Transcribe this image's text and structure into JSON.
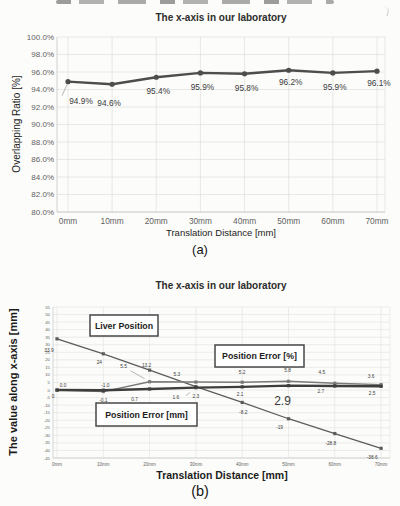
{
  "page": {
    "caption_a": "(a)",
    "caption_b": "(b)"
  },
  "chart_data": [
    {
      "type": "line",
      "title": "The x-axis in our laboratory",
      "xlabel": "Translation Distance [mm]",
      "ylabel": "Overlapping Ratio [%]",
      "categories": [
        "0mm",
        "10mm",
        "20mm",
        "30mm",
        "40mm",
        "50mm",
        "60mm",
        "70mm"
      ],
      "ylim": [
        80,
        100
      ],
      "ytick_step": 2,
      "ytick_format": "percent1",
      "grid": true,
      "legend_position": "none",
      "marker": "circle",
      "series": [
        {
          "name": "Overlapping Ratio [%]",
          "color": "#4d4d4d",
          "width": 2.3,
          "values": [
            94.9,
            94.6,
            95.4,
            95.9,
            95.8,
            96.2,
            95.9,
            96.1
          ],
          "labels": [
            {
              "t": "94.9%",
              "dx": 13,
              "dy": 22,
              "leader": [
                -1,
                3,
                -6,
                14
              ]
            },
            {
              "t": "94.6%",
              "dx": -3,
              "dy": 22
            },
            {
              "t": "95.4%",
              "dx": 2,
              "dy": 17
            },
            {
              "t": "95.9%",
              "dx": 2,
              "dy": 17
            },
            {
              "t": "95.8%",
              "dx": 2,
              "dy": 17
            },
            {
              "t": "96.2%",
              "dx": 2,
              "dy": 15
            },
            {
              "t": "95.9%",
              "dx": 2,
              "dy": 17
            },
            {
              "t": "96.1%",
              "dx": 2,
              "dy": 15
            }
          ]
        }
      ]
    },
    {
      "type": "line",
      "title": "The x-axis in our laboratory",
      "xlabel": "Translation Distance [mm]",
      "ylabel": "The value along x-axis [mm]",
      "categories": [
        "0mm",
        "10mm",
        "20mm",
        "30mm",
        "40mm",
        "50mm",
        "60mm",
        "70mm"
      ],
      "ylim": [
        -45,
        55
      ],
      "ytick_step": 5,
      "ytick_format": "plain",
      "grid": true,
      "legend_position": "inside-boxes",
      "marker": "square",
      "series": [
        {
          "name": "Liver Position",
          "color": "#5c5c5c",
          "width": 1.3,
          "values": [
            33.9,
            24,
            13.2,
            2.3,
            -8.2,
            -19,
            -28.8,
            -38.6
          ],
          "labels": [
            {
              "t": "33.9",
              "dx": -8,
              "dy": 13
            },
            {
              "t": "24",
              "dx": -4,
              "dy": 10
            },
            {
              "t": "13.2",
              "dx": -3,
              "dy": -3,
              "leader": [
                -2,
                -2,
                0,
                0
              ]
            },
            {
              "t": "2.3",
              "dx": 0,
              "dy": 11,
              "leader": [
                -6,
                6,
                -10,
                9
              ]
            },
            {
              "t": "-8.2",
              "dx": 1,
              "dy": 12
            },
            {
              "t": "-19",
              "dx": -9,
              "dy": 10
            },
            {
              "t": "-28.8",
              "dx": -4,
              "dy": 11
            },
            {
              "t": "-38.6",
              "dx": -9,
              "dy": 11
            }
          ]
        },
        {
          "name": "Position Error [%]",
          "color": "#7a7a7a",
          "width": 1.4,
          "values": [
            0.0,
            -1.0,
            5.5,
            5.3,
            5.2,
            5.8,
            4.5,
            3.6
          ],
          "labels": [
            {
              "t": "0.0",
              "dx": 6,
              "dy": -3
            },
            {
              "t": "-1.0",
              "dx": 2,
              "dy": -5
            },
            {
              "t": "5.5",
              "dx": -26,
              "dy": -14,
              "leader": [
                -19,
                -11,
                -5,
                -3
              ]
            },
            {
              "t": "5.3",
              "dx": -19,
              "dy": -6
            },
            {
              "t": "5.2",
              "dx": 0,
              "dy": -8
            },
            {
              "t": "5.8",
              "dx": -1,
              "dy": -9
            },
            {
              "t": "4.5",
              "dx": -13,
              "dy": -9
            },
            {
              "t": "3.6",
              "dx": -10,
              "dy": -7
            }
          ]
        },
        {
          "name": "Position Error [mm]",
          "color": "#3e3e3e",
          "width": 2.4,
          "values": [
            0,
            -0.1,
            0.7,
            1.6,
            2.1,
            2.9,
            2.7,
            2.5
          ],
          "labels": [
            {
              "t": "0",
              "dx": -4,
              "dy": 8
            },
            {
              "t": "-0.1",
              "dx": 0,
              "dy": 12
            },
            {
              "t": "0.7",
              "dx": -15,
              "dy": 12
            },
            {
              "t": "1.6",
              "dx": -20,
              "dy": 11
            },
            {
              "t": "2.1",
              "dx": -2,
              "dy": 9
            },
            {
              "t": "2.9",
              "dx": -6,
              "dy": 19,
              "fs": 12
            },
            {
              "t": "2.7",
              "dx": -14,
              "dy": 7
            },
            {
              "t": "2.5",
              "dx": -9,
              "dy": 9
            }
          ]
        }
      ],
      "legend_boxes": [
        {
          "label": "Liver Position",
          "x": 90,
          "y": 55,
          "w": 68,
          "h": 21
        },
        {
          "label": "Position Error [%]",
          "x": 215,
          "y": 85,
          "w": 89,
          "h": 22
        },
        {
          "label": "Position Error [mm]",
          "x": 96,
          "y": 143,
          "w": 101,
          "h": 23
        }
      ]
    }
  ]
}
